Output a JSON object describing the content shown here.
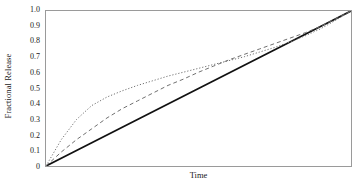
{
  "chart_data": {
    "type": "line",
    "title": "",
    "xlabel": "Time",
    "ylabel": "Fractional Release",
    "xlim": [
      0,
      1
    ],
    "ylim": [
      0,
      1
    ],
    "grid": false,
    "legend": "none",
    "x_tick_labels": [],
    "y_tick_labels": [
      "1.0",
      "0.9",
      "0.8",
      "0.7",
      "0.6",
      "0.5",
      "0.4",
      "0.3",
      "0.2",
      "0.1",
      "0"
    ],
    "y_tick_values": [
      1.0,
      0.9,
      0.8,
      0.7,
      0.6,
      0.5,
      0.4,
      0.3,
      0.2,
      0.1,
      0.0
    ],
    "x": [
      0.0,
      0.05,
      0.1,
      0.15,
      0.2,
      0.25,
      0.3,
      0.35,
      0.4,
      0.45,
      0.5,
      0.55,
      0.6,
      0.65,
      0.7,
      0.75,
      0.8,
      0.85,
      0.9,
      0.95,
      1.0
    ],
    "series": [
      {
        "name": "zero-order release",
        "style": "solid",
        "color": "#111111",
        "width": 1.8,
        "values": [
          0.0,
          0.05,
          0.1,
          0.15,
          0.2,
          0.25,
          0.3,
          0.35,
          0.4,
          0.45,
          0.5,
          0.55,
          0.6,
          0.65,
          0.7,
          0.75,
          0.8,
          0.85,
          0.9,
          0.95,
          1.0
        ]
      },
      {
        "name": "intermediate release",
        "style": "dashed",
        "color": "#6e6e6e",
        "width": 1.0,
        "values": [
          0.0,
          0.09,
          0.17,
          0.24,
          0.31,
          0.37,
          0.42,
          0.47,
          0.52,
          0.56,
          0.605,
          0.645,
          0.685,
          0.72,
          0.755,
          0.79,
          0.825,
          0.86,
          0.9,
          0.95,
          1.0
        ]
      },
      {
        "name": "first-order release",
        "style": "dotted",
        "color": "#6e6e6e",
        "width": 1.0,
        "values": [
          0.0,
          0.17,
          0.3,
          0.39,
          0.445,
          0.485,
          0.52,
          0.55,
          0.58,
          0.605,
          0.63,
          0.655,
          0.68,
          0.705,
          0.735,
          0.765,
          0.8,
          0.84,
          0.885,
          0.94,
          1.0
        ]
      }
    ]
  }
}
